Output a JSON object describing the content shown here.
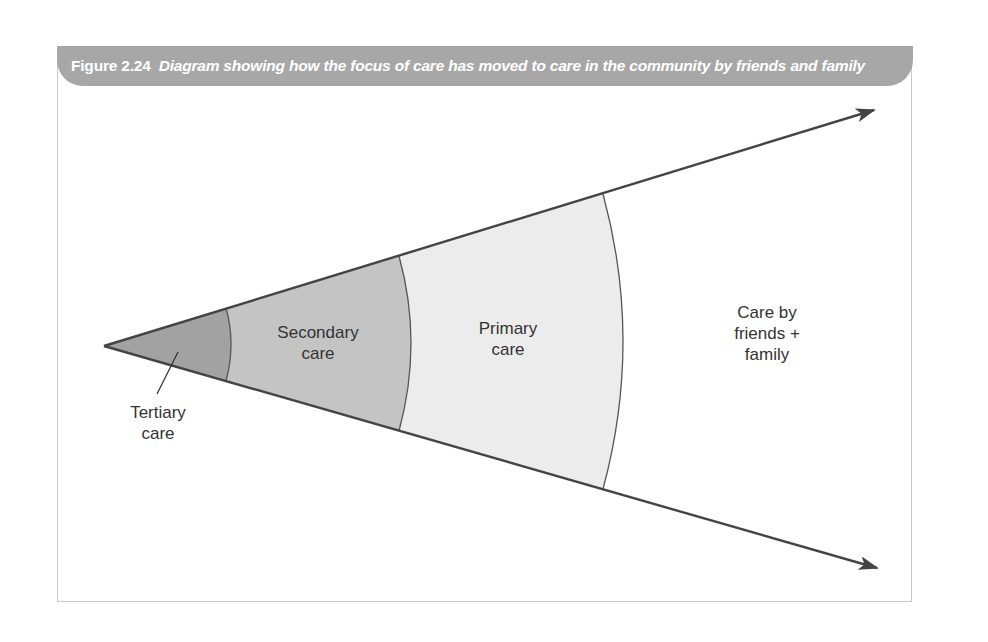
{
  "figure": {
    "number": "Figure 2.24",
    "caption": "Diagram showing how the focus of care has moved to care in the community by friends and family",
    "banner_color": "#a7a7a7"
  },
  "diagram": {
    "type": "expanding-wedge",
    "regions": [
      {
        "id": "tertiary",
        "label": "Tertiary\ncare",
        "fill": "#a2a2a2"
      },
      {
        "id": "secondary",
        "label": "Secondary\ncare",
        "fill": "#c4c4c4"
      },
      {
        "id": "primary",
        "label": "Primary\ncare",
        "fill": "#ececec"
      },
      {
        "id": "friends-family",
        "label": "Care by\nfriends +\nfamily",
        "fill": "#ffffff"
      }
    ],
    "line_color": "#444444"
  }
}
